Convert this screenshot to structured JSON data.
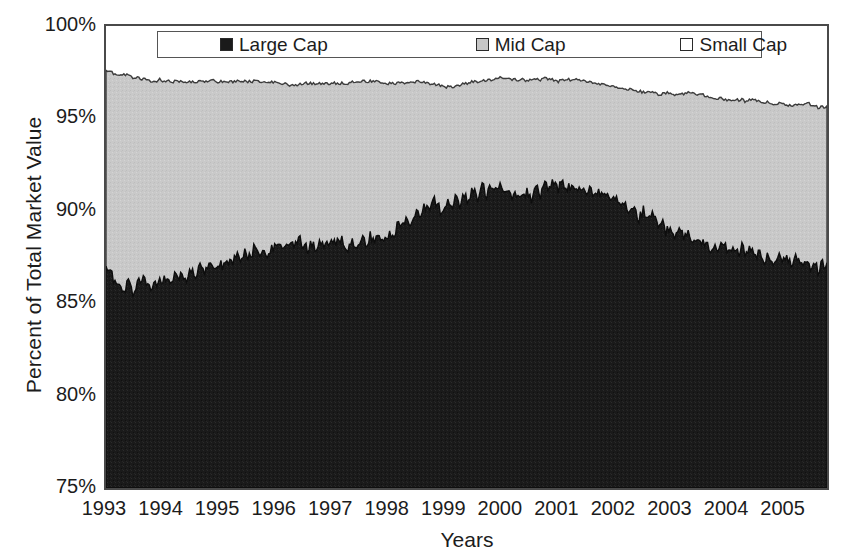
{
  "chart_data": {
    "type": "area",
    "title": "",
    "subtitle": "",
    "xlabel": "Years",
    "ylabel": "Percent of Total Market Value",
    "stacked": true,
    "grid": false,
    "legend_position": "top-inside",
    "ylim": [
      75,
      100
    ],
    "yticks": [
      "75%",
      "80%",
      "85%",
      "90%",
      "95%",
      "100%"
    ],
    "ytick_values": [
      75,
      80,
      85,
      90,
      95,
      100
    ],
    "xlim": [
      1993,
      2005.75
    ],
    "xticks": [
      "1993",
      "1994",
      "1995",
      "1996",
      "1997",
      "1998",
      "1999",
      "2000",
      "2001",
      "2002",
      "2003",
      "2004",
      "2005"
    ],
    "xtick_values": [
      1993,
      1994,
      1995,
      1996,
      1997,
      1998,
      1999,
      2000,
      2001,
      2002,
      2003,
      2004,
      2005
    ],
    "colors": {
      "large_cap": "#1a1a1a",
      "mid_cap": "#c6c6c6",
      "small_cap": "#ffffff",
      "axis": "#4a4a4a",
      "text": "#1c1c1c"
    },
    "legend": [
      {
        "label": "Large Cap",
        "marker": "filled-square",
        "color": "#1a1a1a"
      },
      {
        "label": "Mid Cap",
        "marker": "gray-square",
        "color": "#c6c6c6"
      },
      {
        "label": "Small Cap",
        "marker": "open-square",
        "color": "#ffffff"
      }
    ],
    "series": [
      {
        "name": "Large Cap",
        "note": "cumulative upper boundary of Large Cap band (percent of total market value)",
        "values": [
          87.0,
          86.6,
          86.2,
          85.9,
          85.6,
          86.1,
          85.5,
          86.0,
          86.3,
          86.0,
          85.8,
          86.2,
          86.1,
          86.4,
          86.0,
          86.5,
          86.3,
          86.6,
          86.4,
          86.9,
          86.6,
          87.0,
          86.7,
          87.1,
          86.9,
          87.3,
          87.0,
          87.4,
          87.2,
          87.6,
          87.3,
          87.7,
          87.5,
          87.9,
          87.6,
          88.0,
          87.7,
          88.1,
          87.9,
          88.3,
          88.0,
          88.4,
          88.1,
          88.5,
          88.2,
          87.9,
          88.3,
          88.0,
          88.4,
          88.1,
          88.5,
          88.2,
          88.6,
          88.3,
          88.0,
          88.4,
          88.1,
          88.5,
          88.2,
          88.6,
          88.3,
          88.7,
          88.4,
          88.8,
          88.5,
          89.2,
          89.0,
          89.6,
          89.3,
          90.0,
          89.7,
          90.4,
          90.1,
          90.8,
          90.3,
          89.9,
          90.5,
          90.1,
          90.7,
          90.3,
          90.9,
          90.5,
          91.2,
          90.7,
          91.4,
          90.9,
          91.5,
          91.0,
          91.3,
          90.8,
          91.2,
          90.7,
          91.1,
          90.6,
          91.0,
          90.5,
          91.3,
          90.9,
          91.5,
          91.1,
          91.7,
          91.2,
          91.6,
          91.1,
          91.5,
          91.0,
          91.4,
          90.9,
          91.3,
          90.8,
          91.2,
          90.6,
          91.0,
          90.4,
          90.8,
          90.2,
          90.5,
          89.9,
          90.2,
          89.6,
          90.0,
          89.4,
          89.8,
          89.2,
          89.5,
          88.9,
          89.2,
          88.7,
          89.0,
          88.5,
          88.8,
          88.3,
          88.6,
          88.1,
          88.4,
          88.0,
          88.3,
          87.9,
          88.2,
          87.8,
          88.1,
          87.7,
          88.0,
          87.6,
          87.9,
          87.5,
          87.8,
          87.4,
          87.7,
          87.3,
          87.6,
          87.2,
          87.5,
          87.1,
          87.4,
          87.0,
          87.3,
          86.9,
          87.2,
          86.8,
          87.1,
          86.9
        ]
      },
      {
        "name": "Mid Cap",
        "note": "cumulative upper boundary of Large+Mid bands (percent of total market value)",
        "values": [
          97.6,
          97.5,
          97.4,
          97.3,
          97.4,
          97.3,
          97.2,
          97.2,
          97.1,
          97.1,
          97.0,
          97.0,
          97.1,
          97.0,
          97.0,
          97.0,
          97.0,
          97.0,
          97.0,
          97.0,
          97.0,
          97.0,
          97.0,
          97.0,
          97.1,
          97.0,
          97.0,
          97.0,
          97.0,
          97.0,
          97.0,
          97.0,
          97.0,
          97.0,
          97.0,
          97.0,
          97.0,
          97.0,
          96.9,
          96.9,
          96.9,
          96.8,
          96.8,
          96.8,
          96.9,
          96.9,
          96.9,
          96.9,
          96.9,
          96.9,
          96.9,
          96.9,
          96.9,
          96.9,
          96.9,
          97.0,
          97.0,
          97.0,
          97.0,
          97.0,
          97.0,
          97.0,
          96.9,
          96.9,
          96.9,
          96.9,
          96.9,
          96.9,
          97.0,
          97.0,
          97.0,
          97.0,
          96.9,
          96.9,
          96.8,
          96.8,
          96.7,
          96.7,
          96.7,
          96.8,
          96.9,
          96.9,
          97.0,
          97.0,
          97.0,
          97.1,
          97.1,
          97.1,
          97.2,
          97.1,
          97.2,
          97.1,
          97.1,
          97.1,
          97.0,
          97.1,
          97.1,
          97.1,
          97.2,
          97.1,
          97.1,
          97.0,
          97.1,
          97.1,
          97.1,
          97.1,
          97.1,
          97.0,
          97.0,
          96.9,
          96.9,
          96.8,
          96.8,
          96.7,
          96.7,
          96.6,
          96.6,
          96.6,
          96.5,
          96.5,
          96.4,
          96.4,
          96.4,
          96.3,
          96.3,
          96.4,
          96.4,
          96.3,
          96.3,
          96.3,
          96.4,
          96.4,
          96.3,
          96.3,
          96.2,
          96.2,
          96.1,
          96.1,
          96.0,
          96.0,
          96.0,
          96.0,
          96.0,
          95.9,
          96.0,
          96.0,
          95.9,
          95.9,
          95.9,
          95.8,
          95.8,
          95.8,
          95.7,
          95.7,
          95.7,
          95.7,
          95.8,
          95.8,
          95.7,
          95.6,
          95.6,
          95.6
        ]
      }
    ]
  },
  "axes": {
    "ylabel": "Percent of Total Market Value",
    "xlabel": "Years"
  }
}
